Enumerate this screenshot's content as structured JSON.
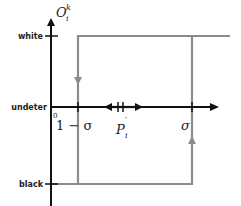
{
  "diagram": {
    "y_axis_label": "O",
    "y_axis_sup": "k",
    "y_axis_sub": "i",
    "levels": {
      "white": "white",
      "undeter": "undeter",
      "black": "black"
    },
    "origin_label": "0",
    "x_ticks": {
      "left": "1 − σ",
      "middle": "P",
      "middle_sup": "′",
      "middle_sub": "i",
      "right": "σ"
    },
    "colors": {
      "axis": "#111111",
      "hysteresis_path": "#8c8c8c",
      "background": "#ffffff"
    }
  }
}
